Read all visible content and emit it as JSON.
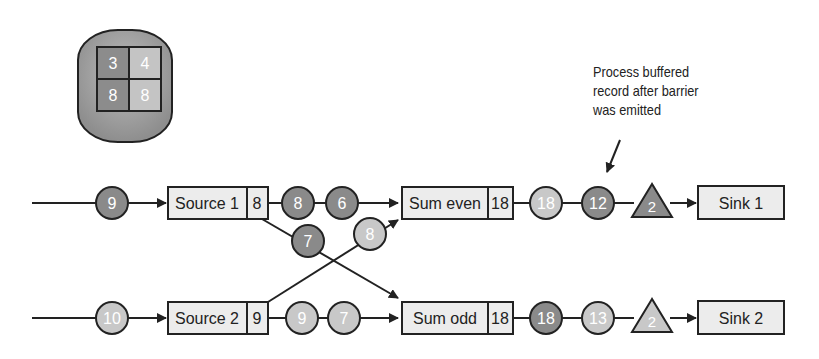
{
  "state_store": {
    "cells": [
      "3",
      "4",
      "8",
      "8"
    ]
  },
  "annotation": {
    "lines": [
      "Process buffered",
      "record after barrier",
      "was emitted"
    ]
  },
  "colors": {
    "dark_record": "#8a8a8a",
    "light_record": "#c8c8c8",
    "box_fill": "#ececec",
    "stroke": "#222222"
  },
  "top_row": {
    "input_record": "9",
    "source": {
      "label": "Source 1",
      "value": "8"
    },
    "out_records": [
      "8",
      "6"
    ],
    "cross_record": "7",
    "sum": {
      "label": "Sum even",
      "value": "18"
    },
    "after_sum": [
      "18",
      "12"
    ],
    "barrier": "2",
    "sink": "Sink 1"
  },
  "bottom_row": {
    "input_record": "10",
    "source": {
      "label": "Source 2",
      "value": "9"
    },
    "out_records": [
      "9",
      "7"
    ],
    "cross_record": "8",
    "sum": {
      "label": "Sum odd",
      "value": "18"
    },
    "after_sum": [
      "18",
      "13"
    ],
    "barrier": "2",
    "sink": "Sink 2"
  }
}
